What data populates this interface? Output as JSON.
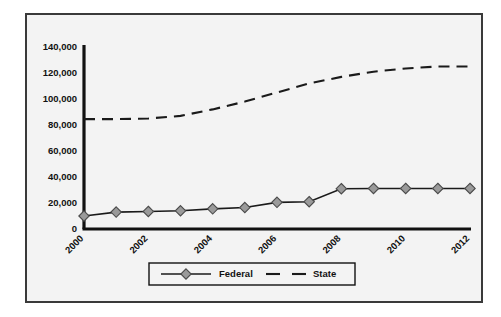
{
  "chart_data": {
    "type": "line",
    "title": "",
    "xlabel": "",
    "ylabel": "",
    "x": [
      2000,
      2001,
      2002,
      2003,
      2004,
      2005,
      2006,
      2007,
      2008,
      2009,
      2010,
      2011,
      2012
    ],
    "xlim": [
      2000,
      2012
    ],
    "ylim": [
      0,
      140000
    ],
    "grid": false,
    "legend_position": "bottom",
    "xtick_labels": [
      "2000",
      "2002",
      "2004",
      "2006",
      "2008",
      "2010",
      "2012"
    ],
    "xtick_values": [
      2000,
      2002,
      2004,
      2006,
      2008,
      2010,
      2012
    ],
    "ytick_labels": [
      "0",
      "20,000",
      "40,000",
      "60,000",
      "80,000",
      "100,000",
      "120,000",
      "140,000"
    ],
    "ytick_values": [
      0,
      20000,
      40000,
      60000,
      80000,
      100000,
      120000,
      140000
    ],
    "series": [
      {
        "name": "Federal",
        "style": "solid-with-diamond-markers",
        "color": "#1a1a1a",
        "marker_fill": "#9a9a9a",
        "values": [
          10000,
          13000,
          13500,
          14000,
          15500,
          16500,
          20500,
          21000,
          31000,
          31200,
          31200,
          31200,
          31200
        ]
      },
      {
        "name": "State",
        "style": "dashed",
        "color": "#1a1a1a",
        "values": [
          84500,
          84500,
          85000,
          87000,
          92000,
          98000,
          105000,
          112000,
          117000,
          121000,
          123500,
          125000,
          125000
        ]
      }
    ]
  },
  "legend": {
    "items": [
      {
        "label": "Federal",
        "style": "solid-marker"
      },
      {
        "label": "State",
        "style": "dashed"
      }
    ]
  },
  "colors": {
    "plot_background": "#f3f3f3",
    "frame_border": "#3a3a3a",
    "axis": "#111111",
    "series_line": "#1a1a1a",
    "marker_fill": "#9a9a9a",
    "marker_stroke": "#4a4a4a"
  }
}
